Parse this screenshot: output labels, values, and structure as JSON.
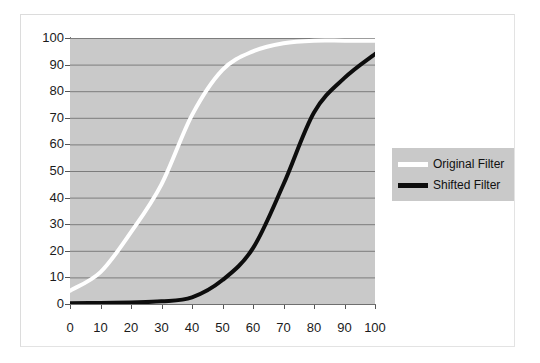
{
  "chart_data": {
    "type": "line",
    "title": "",
    "subtitle": "",
    "xlabel": "",
    "ylabel": "",
    "xlim": [
      0,
      100
    ],
    "ylim": [
      0,
      100
    ],
    "grid": "horizontal",
    "legend_position": "right",
    "plot_background": "#c9c9c9",
    "x": [
      0,
      10,
      20,
      30,
      40,
      50,
      60,
      70,
      80,
      90,
      100
    ],
    "xticks": [
      "0",
      "10",
      "20",
      "30",
      "40",
      "50",
      "60",
      "70",
      "80",
      "90",
      "100"
    ],
    "yticks": [
      "0",
      "10",
      "20",
      "30",
      "40",
      "50",
      "60",
      "70",
      "80",
      "90",
      "100"
    ],
    "series": [
      {
        "name": "Original Filter",
        "color": "#ffffff",
        "values": [
          5,
          12,
          27,
          45,
          71,
          88,
          95,
          98,
          99,
          99,
          99
        ]
      },
      {
        "name": "Shifted Filter",
        "color": "#0d0d0d",
        "values": [
          0.3,
          0.4,
          0.6,
          1.0,
          2.5,
          9,
          21,
          45,
          72,
          85,
          94
        ]
      }
    ]
  },
  "legend": {
    "entries": [
      {
        "label": "Original Filter",
        "swatch": "original"
      },
      {
        "label": "Shifted Filter",
        "swatch": "shifted"
      }
    ]
  }
}
